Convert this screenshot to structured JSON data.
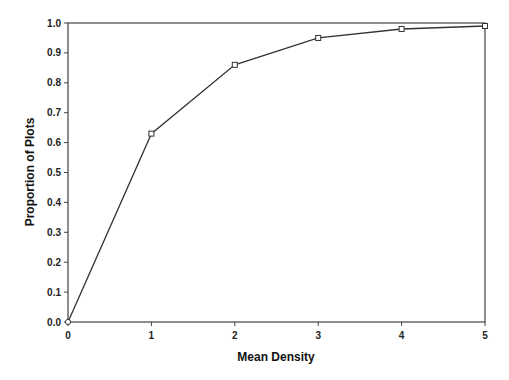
{
  "chart_data": {
    "type": "line",
    "title": "",
    "xlabel": "Mean Density",
    "ylabel": "Proportion of Plots",
    "x": [
      0,
      1,
      2,
      3,
      4,
      5
    ],
    "series": [
      {
        "name": "Proportion of Plots",
        "values": [
          0.0,
          0.63,
          0.86,
          0.95,
          0.98,
          0.99
        ],
        "marker": "square"
      }
    ],
    "xlim": [
      0,
      5
    ],
    "ylim": [
      0.0,
      1.0
    ],
    "xticks": [
      "0",
      "1",
      "2",
      "3",
      "4",
      "5"
    ],
    "yticks": [
      "0.0",
      "0.1",
      "0.2",
      "0.3",
      "0.4",
      "0.5",
      "0.6",
      "0.7",
      "0.8",
      "0.9",
      "1.0"
    ],
    "grid": false,
    "legend": null,
    "colors": {
      "line": "#333333",
      "axis": "#444444",
      "text": "#222222"
    }
  }
}
